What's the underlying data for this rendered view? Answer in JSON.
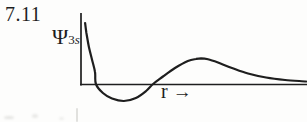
{
  "figure": {
    "number": "7.11",
    "y_label": {
      "symbol": "Ψ",
      "sub_number": "3",
      "sub_letter": "s"
    },
    "x_label": {
      "symbol": "r",
      "arrow": "→"
    }
  },
  "colors": {
    "ink": "#1e1e1e",
    "paper": "#fdfdfc"
  },
  "chart_data": {
    "type": "line",
    "title": "7.11",
    "xlabel": "r",
    "ylabel": "Ψ3s",
    "xlim": [
      0,
      1
    ],
    "ylim": [
      -0.35,
      1.05
    ],
    "grid": false,
    "legend": "none",
    "axis_ticks": "none",
    "style": "hand-drawn qualitative sketch, unscaled axes",
    "features": {
      "zero_crossings_x": [
        0.066,
        0.319
      ],
      "minimum": {
        "x": 0.19,
        "y": -0.28
      },
      "local_maximum": {
        "x": 0.53,
        "y": 0.42
      },
      "behavior": "starts at maximum near r=0, dips negative, small positive hump, decays asymptotically to zero"
    },
    "series": [
      {
        "name": "Ψ3s(r)",
        "points": [
          [
            0.018,
            1.0
          ],
          [
            0.024,
            0.836
          ],
          [
            0.035,
            0.607
          ],
          [
            0.049,
            0.393
          ],
          [
            0.062,
            0.197
          ],
          [
            0.066,
            0.0
          ],
          [
            0.097,
            -0.148
          ],
          [
            0.137,
            -0.238
          ],
          [
            0.19,
            -0.279
          ],
          [
            0.243,
            -0.23
          ],
          [
            0.288,
            -0.115
          ],
          [
            0.319,
            0.0
          ],
          [
            0.363,
            0.123
          ],
          [
            0.416,
            0.262
          ],
          [
            0.473,
            0.377
          ],
          [
            0.509,
            0.41
          ],
          [
            0.531,
            0.421
          ],
          [
            0.562,
            0.405
          ],
          [
            0.606,
            0.352
          ],
          [
            0.668,
            0.262
          ],
          [
            0.739,
            0.172
          ],
          [
            0.819,
            0.107
          ],
          [
            0.903,
            0.066
          ],
          [
            0.996,
            0.041
          ]
        ]
      }
    ]
  }
}
